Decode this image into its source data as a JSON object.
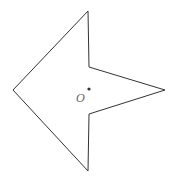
{
  "diagram": {
    "shape": "arrow-quadrilateral",
    "stroke_color": "#333333",
    "vertices": [
      [
        88,
        11
      ],
      [
        89,
        67
      ],
      [
        165,
        90
      ],
      [
        89,
        114
      ],
      [
        88,
        171
      ],
      [
        13,
        90
      ]
    ],
    "center_point": {
      "label": "O",
      "x": 89,
      "y": 89
    }
  }
}
